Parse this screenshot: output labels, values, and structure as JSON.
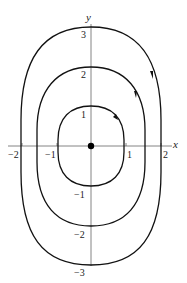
{
  "diagram": {
    "type": "phase-portrait",
    "axes": {
      "x_label": "x",
      "y_label": "y",
      "x_ticks": [
        {
          "value": -2,
          "label": "−2"
        },
        {
          "value": -1,
          "label": "−1"
        },
        {
          "value": 1,
          "label": "1"
        },
        {
          "value": 2,
          "label": "2"
        }
      ],
      "y_ticks": [
        {
          "value": 3,
          "label": "3"
        },
        {
          "value": 2,
          "label": "2"
        },
        {
          "value": 1,
          "label": "1"
        },
        {
          "value": -1,
          "label": "−1"
        },
        {
          "value": -2,
          "label": "−2"
        },
        {
          "value": -3,
          "label": "−3"
        }
      ]
    },
    "equilibrium": {
      "x": 0,
      "y": 0,
      "style": "filled-dot"
    },
    "orbits": [
      {
        "name": "inner",
        "y_intercepts": [
          1,
          -1
        ],
        "x_extent": 0.95,
        "direction": "clockwise"
      },
      {
        "name": "middle",
        "y_intercepts": [
          2,
          -2
        ],
        "x_extent": 1.5,
        "direction": "clockwise"
      },
      {
        "name": "outer",
        "y_intercepts": [
          3,
          -3
        ],
        "x_extent": 1.95,
        "direction": "clockwise"
      }
    ],
    "colors": {
      "curve": "#111111",
      "axis": "#555555",
      "background": "#ffffff"
    }
  }
}
